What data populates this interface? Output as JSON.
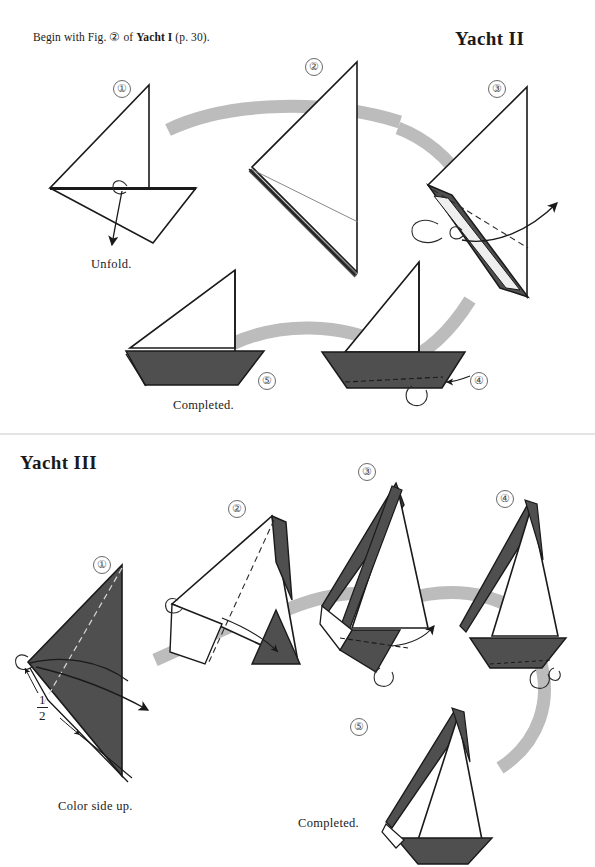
{
  "page": {
    "intro_prefix": "Begin with Fig. ",
    "intro_fig": "②",
    "intro_mid": " of ",
    "intro_model": "Yacht I",
    "intro_suffix": " (p. 30).",
    "background": "#ffffff",
    "ink": "#1a1a1a"
  },
  "colors": {
    "paper_white": "#ffffff",
    "paper_color_side": "#4f4f4f",
    "paper_color_side_dark": "#3a3a3a",
    "ribbon_arrow": "#bcbcbc",
    "outline": "#1a1a1a",
    "fold_dash": "#2a2a2a",
    "step_circle": "#6a6a6a"
  },
  "sections": [
    {
      "id": "yacht-2",
      "title": "Yacht II",
      "steps": [
        {
          "label": "①",
          "caption": "Unfold."
        },
        {
          "label": "②",
          "caption": ""
        },
        {
          "label": "③",
          "caption": ""
        },
        {
          "label": "④",
          "caption": ""
        },
        {
          "label": "⑤",
          "caption": "Completed."
        }
      ]
    },
    {
      "id": "yacht-3",
      "title": "Yacht III",
      "steps": [
        {
          "label": "①",
          "caption": "Color side up.",
          "measure_num": "1",
          "measure_den": "2"
        },
        {
          "label": "②",
          "caption": ""
        },
        {
          "label": "③",
          "caption": ""
        },
        {
          "label": "④",
          "caption": ""
        },
        {
          "label": "⑤",
          "caption": "Completed."
        }
      ]
    }
  ]
}
